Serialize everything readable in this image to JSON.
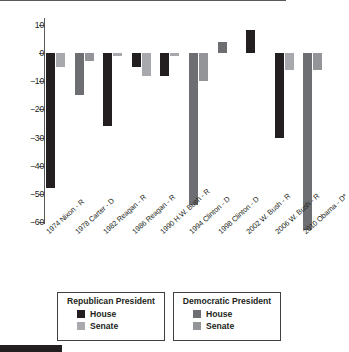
{
  "chart_data": {
    "type": "bar",
    "title": "",
    "subtitle": "",
    "xlabel": "",
    "ylabel": "",
    "ylim": [
      -60,
      10
    ],
    "yticks": [
      10,
      0,
      -10,
      -20,
      -30,
      -40,
      -50,
      -60
    ],
    "ytick_labels": [
      "10",
      "0",
      "−10",
      "−20",
      "−30",
      "−40",
      "−50",
      "−60"
    ],
    "grid": false,
    "zero_line": true,
    "legend_position": "bottom",
    "categories": [
      "1974 Nixon - R",
      "1978 Carter - D",
      "1982 Reagan - R",
      "1986 Reagan - R",
      "1990 H.W. Bush - R",
      "1994 Clinton - D",
      "1998 Clinton - D",
      "2002 W. Bush - R",
      "2006 W. Bush - R",
      "2010 Obama - D*"
    ],
    "series": [
      {
        "name": "House",
        "values": [
          -48,
          -15,
          -26,
          -5,
          -8,
          -54,
          4,
          8,
          -30,
          -63
        ]
      },
      {
        "name": "Senate",
        "values": [
          -5,
          -3,
          -1,
          -8,
          -1,
          -10,
          0,
          0,
          -6,
          -6
        ]
      }
    ],
    "party_by_category": [
      "R",
      "D",
      "R",
      "R",
      "R",
      "D",
      "D",
      "R",
      "R",
      "D"
    ],
    "colors": {
      "republican_house": "#231f20",
      "republican_senate": "#a7a9ac",
      "democratic_house": "#6d6e71",
      "democratic_senate": "#939598",
      "axis": "#58595b",
      "text": "#231f20"
    }
  },
  "legend": {
    "republican": {
      "title": "Republican President",
      "items": [
        {
          "label": "House",
          "color": "#231f20"
        },
        {
          "label": "Senate",
          "color": "#a7a9ac"
        }
      ]
    },
    "democratic": {
      "title": "Democratic President",
      "items": [
        {
          "label": "House",
          "color": "#6d6e71"
        },
        {
          "label": "Senate",
          "color": "#939598"
        }
      ]
    }
  }
}
